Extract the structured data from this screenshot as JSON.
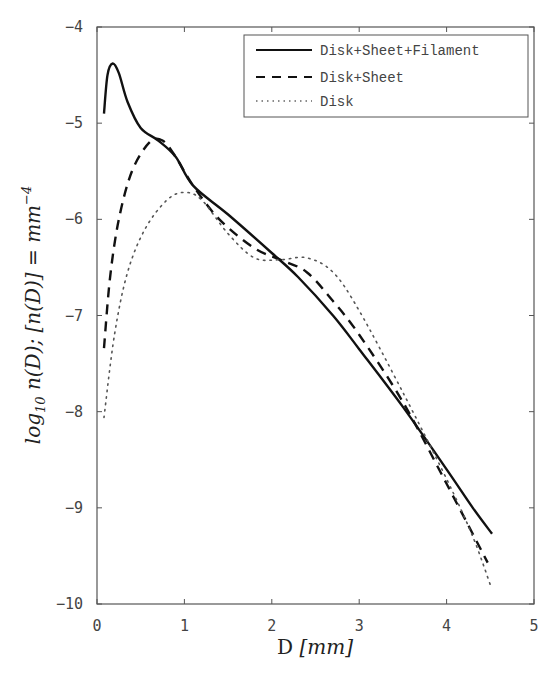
{
  "chart_data": {
    "type": "line",
    "title": "",
    "xlabel": "D [mm]",
    "xlabel_parts": {
      "main": "D ",
      "unit": "[mm]"
    },
    "ylabel": "log10 n(D); [n(D)] = mm^-4",
    "xlim": [
      0,
      5
    ],
    "ylim": [
      -10,
      -4
    ],
    "xticks": [
      "0",
      "1",
      "2",
      "3",
      "4",
      "5"
    ],
    "yticks": [
      "-4",
      "-5",
      "-6",
      "-7",
      "-8",
      "-9",
      "-10"
    ],
    "grid": false,
    "legend_position": "upper right",
    "series": [
      {
        "name": "Disk+Sheet+Filament",
        "style": "solid",
        "x": [
          0.08,
          0.12,
          0.18,
          0.25,
          0.35,
          0.5,
          0.7,
          0.9,
          1.1,
          1.5,
          2.0,
          2.3,
          2.7,
          3.0,
          3.5,
          4.0,
          4.3,
          4.52
        ],
        "values": [
          -4.9,
          -4.5,
          -4.38,
          -4.48,
          -4.78,
          -5.05,
          -5.18,
          -5.35,
          -5.65,
          -5.95,
          -6.35,
          -6.6,
          -7.0,
          -7.35,
          -7.95,
          -8.6,
          -9.0,
          -9.27
        ]
      },
      {
        "name": "Disk+Sheet",
        "style": "dashed",
        "x": [
          0.08,
          0.15,
          0.25,
          0.4,
          0.6,
          0.75,
          0.9,
          1.1,
          1.4,
          1.8,
          2.1,
          2.4,
          2.7,
          3.0,
          3.5,
          4.0,
          4.47
        ],
        "values": [
          -7.34,
          -6.6,
          -6.0,
          -5.5,
          -5.2,
          -5.18,
          -5.35,
          -5.65,
          -6.0,
          -6.3,
          -6.42,
          -6.55,
          -6.85,
          -7.2,
          -7.9,
          -8.75,
          -9.57
        ]
      },
      {
        "name": "Disk",
        "style": "dotted",
        "x": [
          0.08,
          0.2,
          0.35,
          0.55,
          0.8,
          1.0,
          1.2,
          1.5,
          1.8,
          2.1,
          2.4,
          2.7,
          3.0,
          3.5,
          4.0,
          4.3,
          4.5
        ],
        "values": [
          -8.06,
          -7.2,
          -6.55,
          -6.1,
          -5.8,
          -5.72,
          -5.8,
          -6.15,
          -6.4,
          -6.42,
          -6.4,
          -6.55,
          -6.95,
          -7.8,
          -8.7,
          -9.3,
          -9.8
        ]
      }
    ]
  },
  "legend": {
    "items": [
      {
        "label": "Disk+Sheet+Filament"
      },
      {
        "label": "Disk+Sheet"
      },
      {
        "label": "Disk"
      }
    ]
  },
  "colors": {
    "line": "#111111",
    "axis": "#555555",
    "text": "#444444"
  }
}
